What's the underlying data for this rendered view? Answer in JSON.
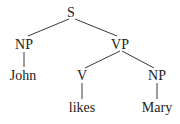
{
  "diagram": {
    "type": "syntax-tree",
    "nodes": {
      "s": "S",
      "np_subject": "NP",
      "vp": "VP",
      "subject_word": "John",
      "v": "V",
      "np_object": "NP",
      "verb_word": "likes",
      "object_word": "Mary"
    },
    "edges": [
      [
        "S",
        "NP"
      ],
      [
        "S",
        "VP"
      ],
      [
        "NP",
        "John"
      ],
      [
        "VP",
        "V"
      ],
      [
        "VP",
        "NP"
      ],
      [
        "V",
        "likes"
      ],
      [
        "NP",
        "Mary"
      ]
    ],
    "colors": {
      "line": "#3a3a3a",
      "text": "#222222",
      "background": "#ffffff"
    }
  }
}
